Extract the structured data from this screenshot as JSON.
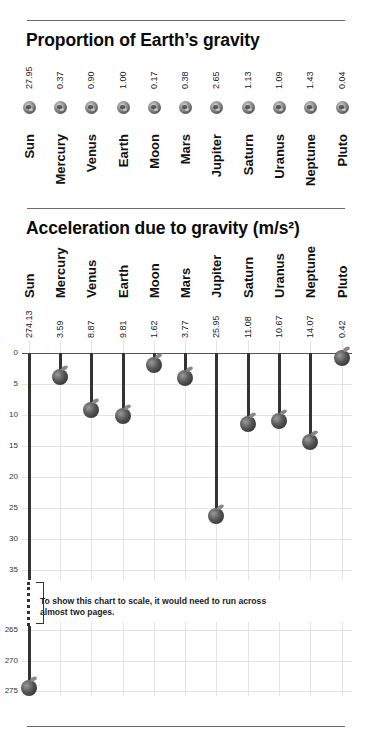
{
  "section1": {
    "title": "Proportion of Earth’s gravity",
    "icon": "earth-globe-icon"
  },
  "section2": {
    "title": "Acceleration due to gravity (m/s²)",
    "icon": "apple-icon",
    "y_ticks_upper": [
      "0",
      "5",
      "10",
      "15",
      "20",
      "25",
      "30",
      "35"
    ],
    "y_ticks_lower": [
      "265",
      "270",
      "275"
    ],
    "note": "To show this chart to scale, it would need to run across almost two pages."
  },
  "bodies": [
    {
      "name": "Sun",
      "proportion": "27.95",
      "accel": "274.13"
    },
    {
      "name": "Mercury",
      "proportion": "0.37",
      "accel": "3.59"
    },
    {
      "name": "Venus",
      "proportion": "0.90",
      "accel": "8.87"
    },
    {
      "name": "Earth",
      "proportion": "1.00",
      "accel": "9.81"
    },
    {
      "name": "Moon",
      "proportion": "0.17",
      "accel": "1.62"
    },
    {
      "name": "Mars",
      "proportion": "0.38",
      "accel": "3.77"
    },
    {
      "name": "Jupiter",
      "proportion": "2.65",
      "accel": "25.95"
    },
    {
      "name": "Saturn",
      "proportion": "1.13",
      "accel": "11.08"
    },
    {
      "name": "Uranus",
      "proportion": "1.09",
      "accel": "10.67"
    },
    {
      "name": "Neptune",
      "proportion": "1.43",
      "accel": "14.07"
    },
    {
      "name": "Pluto",
      "proportion": "0.04",
      "accel": "0.42"
    }
  ],
  "chart_data": [
    {
      "type": "table",
      "title": "Proportion of Earth’s gravity",
      "categories": [
        "Sun",
        "Mercury",
        "Venus",
        "Earth",
        "Moon",
        "Mars",
        "Jupiter",
        "Saturn",
        "Uranus",
        "Neptune",
        "Pluto"
      ],
      "values": [
        27.95,
        0.37,
        0.9,
        1.0,
        0.17,
        0.38,
        2.65,
        1.13,
        1.09,
        1.43,
        0.04
      ]
    },
    {
      "type": "bar",
      "title": "Acceleration due to gravity (m/s²)",
      "orientation": "vertical-hanging",
      "categories": [
        "Sun",
        "Mercury",
        "Venus",
        "Earth",
        "Moon",
        "Mars",
        "Jupiter",
        "Saturn",
        "Uranus",
        "Neptune",
        "Pluto"
      ],
      "values": [
        274.13,
        3.59,
        8.87,
        9.81,
        1.62,
        3.77,
        25.95,
        11.08,
        10.67,
        14.07,
        0.42
      ],
      "xlabel": "",
      "ylabel": "",
      "y_ticks": [
        0,
        5,
        10,
        15,
        20,
        25,
        30,
        35,
        265,
        270,
        275
      ],
      "axis_break": [
        37,
        262
      ],
      "grid": true,
      "annotation": "To show this chart to scale, it would need to run across almost two pages."
    }
  ]
}
